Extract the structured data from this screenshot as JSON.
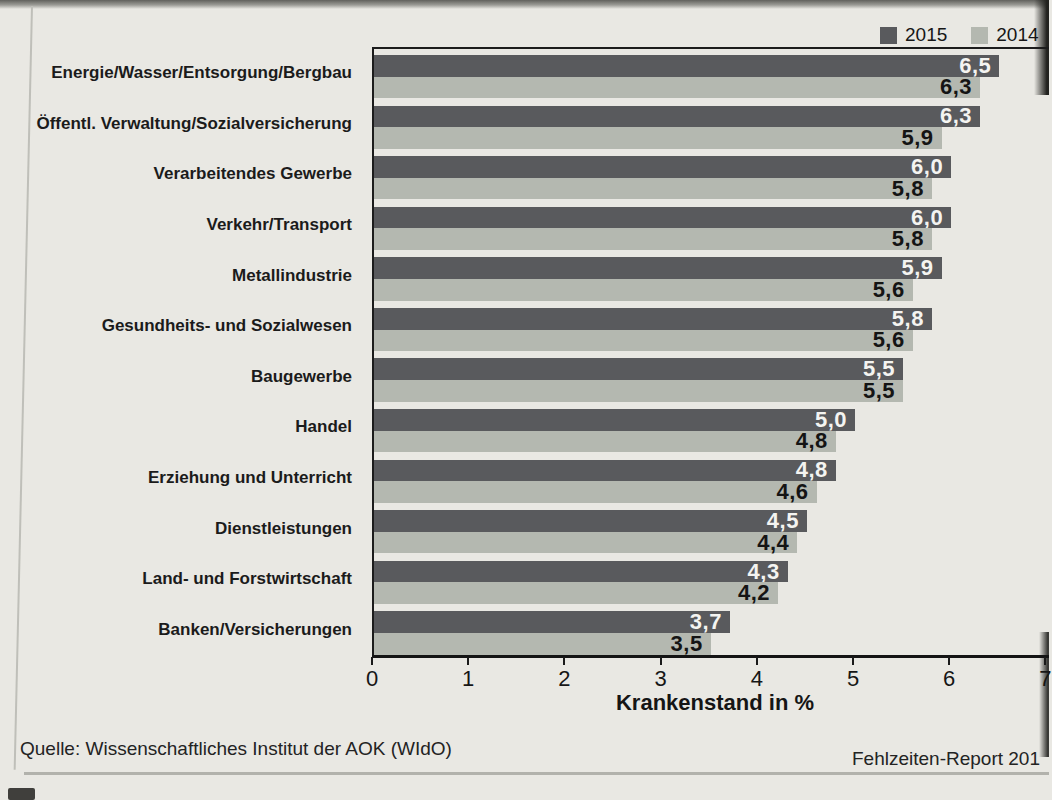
{
  "page": {
    "source_note": "Quelle: Wissenschaftliches Institut der AOK (WIdO)",
    "footer_right": "Fehlzeiten-Report 201"
  },
  "chart_data": {
    "type": "bar",
    "orientation": "horizontal",
    "title": "",
    "xlabel": "Krankenstand in %",
    "xlim": [
      0,
      7
    ],
    "xticks": [
      0,
      1,
      2,
      3,
      4,
      5,
      6,
      7
    ],
    "grid": false,
    "legend_position": "top-right",
    "decimal_separator": ",",
    "categories": [
      "Energie/Wasser/Entsorgung/Bergbau",
      "Öffentl. Verwaltung/Sozialversicherung",
      "Verarbeitendes Gewerbe",
      "Verkehr/Transport",
      "Metallindustrie",
      "Gesundheits- und Sozialwesen",
      "Baugewerbe",
      "Handel",
      "Erziehung und Unterricht",
      "Dienstleistungen",
      "Land- und Forstwirtschaft",
      "Banken/Versicherungen"
    ],
    "series": [
      {
        "name": "2015",
        "color": "#595a5d",
        "values": [
          6.5,
          6.3,
          6.0,
          6.0,
          5.9,
          5.8,
          5.5,
          5.0,
          4.8,
          4.5,
          4.3,
          3.7
        ]
      },
      {
        "name": "2014",
        "color": "#b4b8b0",
        "values": [
          6.3,
          5.9,
          5.8,
          5.8,
          5.6,
          5.6,
          5.5,
          4.8,
          4.6,
          4.4,
          4.2,
          3.5
        ]
      }
    ]
  },
  "colors": {
    "paper": "#e9e8e3",
    "axis": "#1c1c1c",
    "value_on_dark": "#f4f4f1",
    "value_on_light": "#141414"
  }
}
